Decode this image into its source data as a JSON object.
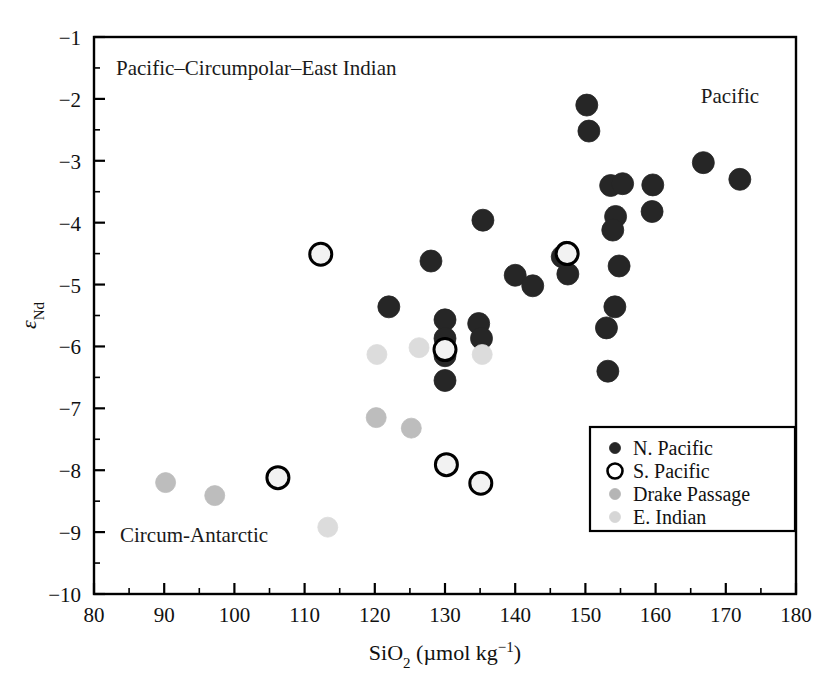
{
  "figure": {
    "background_color": "#ffffff",
    "width": 836,
    "height": 684,
    "top_ghost_text": ""
  },
  "annotations": {
    "upper_left": "Pacific–Circumpolar–East Indian",
    "upper_right": "Pacific",
    "lower_left": "Circum-Antarctic"
  },
  "legend": {
    "position": "inner-lower-right",
    "items": [
      {
        "label": "N. Pacific",
        "marker": "filled-circle",
        "color": "#262626",
        "edge": "#262626",
        "size": "small"
      },
      {
        "label": "S. Pacific",
        "marker": "open-circle",
        "color": "#ffffff",
        "edge": "#000000",
        "size": "small"
      },
      {
        "label": "Drake Passage",
        "marker": "filled-circle",
        "color": "#b5b5b5",
        "edge": "#b5b5b5",
        "size": "small"
      },
      {
        "label": "E. Indian",
        "marker": "filled-circle",
        "color": "#d6d6d6",
        "edge": "#d6d6d6",
        "size": "small"
      }
    ]
  },
  "chart_data": {
    "type": "scatter",
    "title": "",
    "xlabel": "SiO2 (µmol kg−1)",
    "xlabel_parts": {
      "base": "SiO",
      "sub": "2",
      "unit_open": " (µmol kg",
      "sup": "−1",
      "unit_close": ")"
    },
    "ylabel": "εNd",
    "ylabel_parts": {
      "base": "ε",
      "sub": "Nd"
    },
    "xlim": [
      80,
      180
    ],
    "ylim": [
      -10,
      -1
    ],
    "xticks": [
      80,
      90,
      100,
      110,
      120,
      130,
      140,
      150,
      160,
      170,
      180
    ],
    "xticklabels": [
      "80",
      "90",
      "100",
      "110",
      "120",
      "130",
      "140",
      "150",
      "160",
      "170",
      "180"
    ],
    "xminor_step": 5,
    "yticks": [
      -1,
      -2,
      -3,
      -4,
      -5,
      -6,
      -7,
      -8,
      -9,
      -10
    ],
    "yticklabels": [
      "−1",
      "−2",
      "−3",
      "−4",
      "−5",
      "−6",
      "−7",
      "−8",
      "−9",
      "−10"
    ],
    "yminor_step": 0.5,
    "grid": false,
    "series": [
      {
        "name": "N. Pacific",
        "marker": "filled-circle",
        "color": "#262626",
        "edge": "#262626",
        "radius": 11,
        "points": [
          [
            150.2,
            -2.1
          ],
          [
            150.5,
            -2.52
          ],
          [
            166.8,
            -3.03
          ],
          [
            172.0,
            -3.3
          ],
          [
            153.6,
            -3.4
          ],
          [
            159.6,
            -3.39
          ],
          [
            155.3,
            -3.37
          ],
          [
            159.5,
            -3.82
          ],
          [
            154.3,
            -3.9
          ],
          [
            153.9,
            -4.12
          ],
          [
            135.4,
            -3.96
          ],
          [
            147.3,
            -4.48
          ],
          [
            146.7,
            -4.55
          ],
          [
            154.8,
            -4.7
          ],
          [
            140.0,
            -4.85
          ],
          [
            142.5,
            -5.02
          ],
          [
            147.5,
            -4.83
          ],
          [
            128.0,
            -4.62
          ],
          [
            122.0,
            -5.36
          ],
          [
            154.2,
            -5.36
          ],
          [
            153.0,
            -5.7
          ],
          [
            130.0,
            -5.57
          ],
          [
            134.8,
            -5.63
          ],
          [
            130.0,
            -5.87
          ],
          [
            135.2,
            -5.87
          ],
          [
            130.0,
            -6.15
          ],
          [
            130.0,
            -6.55
          ],
          [
            153.2,
            -6.4
          ]
        ]
      },
      {
        "name": "S. Pacific",
        "marker": "open-circle",
        "color": "#f2f2f2",
        "edge": "#000000",
        "radius": 11,
        "points": [
          [
            112.3,
            -4.51
          ],
          [
            147.4,
            -4.5
          ],
          [
            130.0,
            -6.05
          ],
          [
            106.2,
            -8.12
          ],
          [
            130.2,
            -7.91
          ],
          [
            135.1,
            -8.21
          ]
        ]
      },
      {
        "name": "Drake Passage",
        "marker": "filled-circle",
        "color": "#bdbdbd",
        "edge": "#bdbdbd",
        "radius": 10,
        "points": [
          [
            120.2,
            -7.15
          ],
          [
            125.2,
            -7.32
          ],
          [
            90.2,
            -8.2
          ],
          [
            97.2,
            -8.41
          ]
        ]
      },
      {
        "name": "E. Indian",
        "marker": "filled-circle",
        "color": "#dcdcdc",
        "edge": "#dcdcdc",
        "radius": 10,
        "points": [
          [
            120.3,
            -6.13
          ],
          [
            126.3,
            -6.02
          ],
          [
            135.3,
            -6.13
          ],
          [
            113.3,
            -8.92
          ]
        ]
      }
    ]
  }
}
